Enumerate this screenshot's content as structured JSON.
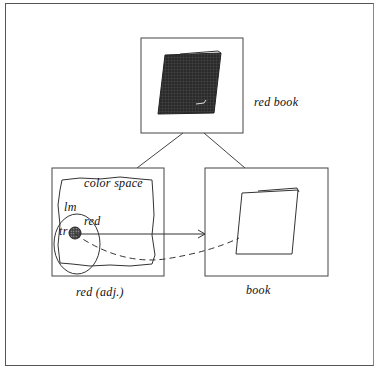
{
  "diagram": {
    "top_panel": {
      "label": "red book",
      "content": "dark-hatched-book"
    },
    "left_panel": {
      "caption": "red (adj.)",
      "region_label": "color space",
      "lm_label": "lm",
      "tr_label": "tr",
      "red_label": "red"
    },
    "right_panel": {
      "caption": "book",
      "content": "outline-book"
    },
    "connections": [
      {
        "from": "top_panel",
        "to": "left_panel",
        "style": "solid"
      },
      {
        "from": "top_panel",
        "to": "right_panel",
        "style": "solid"
      },
      {
        "from": "tr",
        "to": "right_panel",
        "style": "arrow"
      },
      {
        "from": "tr",
        "to": "book_outline",
        "style": "dashed"
      }
    ],
    "colors": {
      "line": "#333333",
      "fill_dark": "#2a2a2a"
    }
  }
}
